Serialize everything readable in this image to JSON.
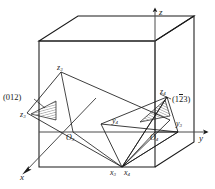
{
  "figure": {
    "kind": "crystallographic-miller-index-diagram",
    "background_color": "#ffffff",
    "line_color": "#1a1a1a",
    "hatch_color": "#1a1a1a"
  },
  "axes": [
    {
      "id": "z",
      "label": "z",
      "arrow": "up"
    },
    {
      "id": "y",
      "label": "y",
      "arrow": "right"
    },
    {
      "id": "x",
      "label": "x",
      "arrow": "down-left"
    }
  ],
  "origins": [
    {
      "id": "O3",
      "base": "O",
      "sub": "3"
    },
    {
      "id": "O4",
      "base": "O",
      "sub": "4"
    }
  ],
  "intercepts": [
    {
      "id": "z3",
      "base": "z",
      "sub": "3"
    },
    {
      "id": "z3b",
      "base": "z",
      "sub": "3"
    },
    {
      "id": "y3",
      "base": "y",
      "sub": "3"
    },
    {
      "id": "x3",
      "base": "x",
      "sub": "3"
    },
    {
      "id": "z4",
      "base": "z",
      "sub": "4"
    },
    {
      "id": "y4",
      "base": "y",
      "sub": "4"
    },
    {
      "id": "x4",
      "base": "x",
      "sub": "4"
    }
  ],
  "plane_labels": [
    {
      "id": "plane-012",
      "open": "(",
      "digits": [
        {
          "value": "0",
          "bar": false
        },
        {
          "value": "1",
          "bar": false
        },
        {
          "value": "2",
          "bar": false
        }
      ],
      "close": ")",
      "text": "(012)"
    },
    {
      "id": "plane-1-2-3",
      "open": "(",
      "digits": [
        {
          "value": "1",
          "bar": false
        },
        {
          "value": "2",
          "bar": true
        },
        {
          "value": "3",
          "bar": false
        }
      ],
      "close": ")",
      "text": "(123)"
    }
  ]
}
